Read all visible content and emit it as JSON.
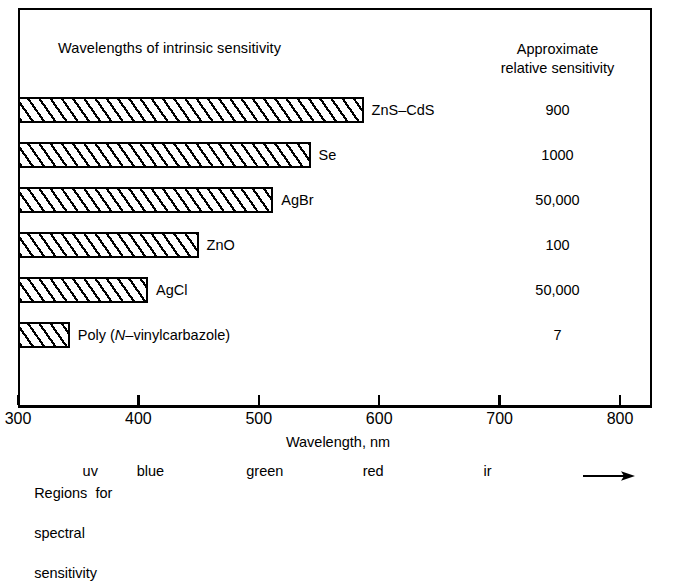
{
  "chart_data": {
    "type": "bar",
    "orientation": "horizontal",
    "title": "",
    "header_left": "Wavelengths of intrinsic sensitivity",
    "header_right_line1": "Approximate",
    "header_right_line2": "relative sensitivity",
    "xlabel": "Wavelength, nm",
    "ylabel": "",
    "xlim": [
      300,
      800
    ],
    "xticks": [
      300,
      400,
      500,
      600,
      700,
      800
    ],
    "xtick_labels": [
      "300",
      "400",
      "500",
      "600",
      "700",
      "800"
    ],
    "grid": false,
    "legend": "none",
    "bar_start_nm": 300,
    "categories": [
      "ZnS–CdS",
      "Se",
      "AgBr",
      "ZnO",
      "AgCl",
      "Poly (N–vinylcarbazole)"
    ],
    "values": [
      587,
      543,
      512,
      450,
      408,
      343
    ],
    "annotations": [
      {
        "label": "ZnS–CdS",
        "end_nm": 587,
        "sensitivity": "900"
      },
      {
        "label": "Se",
        "end_nm": 543,
        "sensitivity": "1000"
      },
      {
        "label": "AgBr",
        "end_nm": 512,
        "sensitivity": "50,000"
      },
      {
        "label": "ZnO",
        "end_nm": 450,
        "sensitivity": "100"
      },
      {
        "label": "AgCl",
        "end_nm": 408,
        "sensitivity": "50,000"
      },
      {
        "label": "Poly (N–vinylcarbazole)",
        "end_nm": 343,
        "sensitivity": "7"
      }
    ],
    "spectral_regions": {
      "caption_line1": "Regions for",
      "caption_line2": "spectral",
      "caption_line3": "sensitivity",
      "words": [
        {
          "text": "uv",
          "center_nm": 360
        },
        {
          "text": "blue",
          "center_nm": 410
        },
        {
          "text": "green",
          "center_nm": 505
        },
        {
          "text": "red",
          "center_nm": 595
        },
        {
          "text": "ir",
          "center_nm": 690
        }
      ]
    },
    "colors": {
      "ink": "#000000",
      "background": "#ffffff",
      "bar_fill": "#ffffff",
      "bar_hatch": "#000000"
    }
  },
  "bars": [
    {
      "label": "ZnS–CdS",
      "sensitivity": "900"
    },
    {
      "label": "Se",
      "sensitivity": "1000"
    },
    {
      "label": "AgBr",
      "sensitivity": "50,000"
    },
    {
      "label": "ZnO",
      "sensitivity": "100"
    },
    {
      "label": "AgCl",
      "sensitivity": "50,000"
    },
    {
      "label_pre": "Poly  (",
      "label_italic": "N",
      "label_post": "–vinylcarbazole)",
      "sensitivity": "7"
    }
  ],
  "header": {
    "left": "Wavelengths of intrinsic sensitivity",
    "right_line1": "Approximate",
    "right_line2": "relative sensitivity"
  },
  "axis": {
    "title": "Wavelength,  nm",
    "ticks": [
      "300",
      "400",
      "500",
      "600",
      "700",
      "800"
    ]
  },
  "regions": {
    "line1": "Regions  for",
    "line2": "spectral",
    "line3": "sensitivity",
    "uv": "uv",
    "blue": "blue",
    "green": "green",
    "red": "red",
    "ir": "ir"
  }
}
